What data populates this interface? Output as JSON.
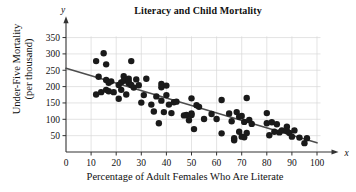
{
  "chart_data": {
    "type": "scatter",
    "title": "Literacy and Child Mortality",
    "xlabel": "Percentage of Adult Females Who Are Literate",
    "ylabel_line1": "Under-Five Mortality",
    "ylabel_line2": "(per thousand)",
    "x_axis_variable": "x",
    "y_axis_variable": "y",
    "xlim": [
      0,
      103
    ],
    "ylim": [
      0,
      372
    ],
    "xticks": [
      0,
      10,
      20,
      30,
      40,
      50,
      60,
      70,
      80,
      90,
      100
    ],
    "xtick_labels": [
      "0",
      "10",
      "20",
      "30",
      "40",
      "50",
      "60",
      "70",
      "80",
      "90",
      "100"
    ],
    "yticks": [
      50,
      100,
      150,
      200,
      250,
      300,
      350
    ],
    "ytick_labels": [
      "50",
      "100",
      "150",
      "200",
      "250",
      "300",
      "350"
    ],
    "grid": true,
    "grid_color": "#d9d9d9",
    "legend": null,
    "marker_color": "#1a1a1a",
    "marker_size": 3.2,
    "trendline": {
      "type": "linear-fit",
      "color": "#4d4d4d",
      "width": 1.6,
      "x_start": 0,
      "y_start": 256,
      "x_end": 100,
      "y_end": 28
    },
    "points": [
      [
        12,
        278
      ],
      [
        12,
        176
      ],
      [
        13,
        230
      ],
      [
        14,
        183
      ],
      [
        15,
        302
      ],
      [
        16,
        268
      ],
      [
        16,
        220
      ],
      [
        16,
        190
      ],
      [
        17,
        212
      ],
      [
        17,
        186
      ],
      [
        18,
        216
      ],
      [
        19,
        183
      ],
      [
        21,
        205
      ],
      [
        21,
        163
      ],
      [
        22,
        213
      ],
      [
        22,
        190
      ],
      [
        23,
        232
      ],
      [
        23,
        218
      ],
      [
        24,
        176
      ],
      [
        25,
        224
      ],
      [
        25,
        210
      ],
      [
        25,
        214
      ],
      [
        26,
        278
      ],
      [
        26,
        205
      ],
      [
        27,
        197
      ],
      [
        28,
        222
      ],
      [
        29,
        204
      ],
      [
        30,
        151
      ],
      [
        31,
        174
      ],
      [
        32,
        224
      ],
      [
        34,
        145
      ],
      [
        35,
        124
      ],
      [
        36,
        170
      ],
      [
        37,
        88
      ],
      [
        38,
        208
      ],
      [
        38,
        198
      ],
      [
        38,
        157
      ],
      [
        39,
        122
      ],
      [
        40,
        203
      ],
      [
        40,
        174
      ],
      [
        41,
        145
      ],
      [
        42,
        119
      ],
      [
        43,
        152
      ],
      [
        44,
        154
      ],
      [
        47,
        112
      ],
      [
        48,
        113
      ],
      [
        49,
        97
      ],
      [
        50,
        164
      ],
      [
        50,
        118
      ],
      [
        50,
        113
      ],
      [
        51,
        70
      ],
      [
        52,
        143
      ],
      [
        53,
        138
      ],
      [
        55,
        101
      ],
      [
        58,
        116
      ],
      [
        60,
        101
      ],
      [
        62,
        159
      ],
      [
        62,
        57
      ],
      [
        65,
        118
      ],
      [
        66,
        94
      ],
      [
        67,
        36
      ],
      [
        67,
        42
      ],
      [
        68,
        122
      ],
      [
        69,
        108
      ],
      [
        69,
        62
      ],
      [
        70,
        110
      ],
      [
        70,
        47
      ],
      [
        71,
        45
      ],
      [
        71,
        92
      ],
      [
        72,
        165
      ],
      [
        72,
        58
      ],
      [
        73,
        98
      ],
      [
        74,
        86
      ],
      [
        80,
        119
      ],
      [
        80,
        88
      ],
      [
        81,
        51
      ],
      [
        82,
        91
      ],
      [
        83,
        62
      ],
      [
        84,
        85
      ],
      [
        85,
        60
      ],
      [
        86,
        66
      ],
      [
        88,
        77
      ],
      [
        88,
        64
      ],
      [
        89,
        58
      ],
      [
        90,
        47
      ],
      [
        91,
        66
      ],
      [
        93,
        44
      ],
      [
        95,
        27
      ],
      [
        96,
        42
      ]
    ]
  }
}
